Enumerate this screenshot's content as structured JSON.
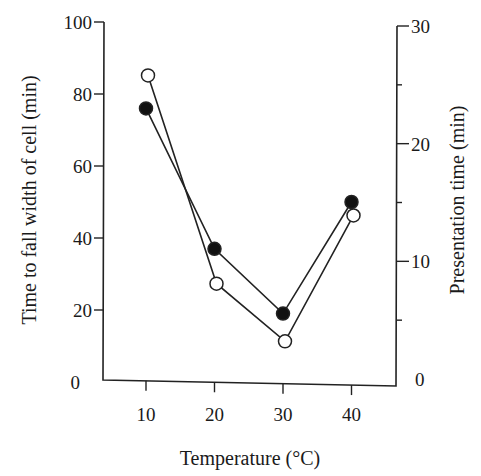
{
  "chart_data": {
    "type": "line",
    "title": "",
    "xlabel": "Temperature (°C)",
    "ylabel": "Time to fall width of cell (min)",
    "ylabel_right": "Presentation time (min)",
    "x": [
      10,
      20,
      30,
      40
    ],
    "x_ticks": [
      "10",
      "20",
      "30",
      "40"
    ],
    "y_ticks_left": [
      "0",
      "20",
      "40",
      "60",
      "80",
      "100"
    ],
    "y_ticks_right": [
      "0",
      "10",
      "20",
      "30"
    ],
    "ylim_left": [
      0,
      100
    ],
    "ylim_right": [
      0,
      30
    ],
    "grid": false,
    "legend": "none",
    "series": [
      {
        "name": "Time to fall width of cell",
        "marker": "filled-circle",
        "axis": "left",
        "values": [
          76,
          37,
          19,
          50
        ]
      },
      {
        "name": "Presentation time",
        "marker": "open-circle",
        "axis": "right",
        "values": [
          25.8,
          8.1,
          3.2,
          13.9
        ]
      }
    ]
  }
}
